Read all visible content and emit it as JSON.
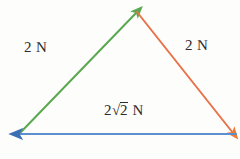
{
  "figure": {
    "type": "vector-triangle-diagram",
    "background_color": "#fdfdfb",
    "text_color": "#2b2b2b",
    "width": 240,
    "height": 159
  },
  "labels": {
    "left_vector": "2 N",
    "right_vector": "2 N",
    "bottom_vector_coefficient": "2",
    "bottom_vector_radical": "√",
    "bottom_vector_radicand": "2",
    "bottom_vector_unit": "N"
  },
  "vectors": [
    {
      "name": "left-green-vector",
      "label": "2 N",
      "magnitude": 2,
      "unit": "N",
      "color": "#5aa84f",
      "from": [
        20,
        133
      ],
      "to": [
        137,
        12
      ],
      "arrow_at": "to",
      "direction": "up-right"
    },
    {
      "name": "right-orange-vector",
      "label": "2 N",
      "magnitude": 2,
      "unit": "N",
      "color": "#e8734a",
      "from": [
        137,
        12
      ],
      "to": [
        233,
        133
      ],
      "arrow_at": "to",
      "direction": "down-right"
    },
    {
      "name": "bottom-blue-vector",
      "label": "2√2 N",
      "magnitude": 2.828,
      "unit": "N",
      "color": "#5b8fd0",
      "from": [
        236,
        134
      ],
      "to": [
        18,
        134
      ],
      "arrow_at": "to",
      "direction": "left"
    }
  ]
}
